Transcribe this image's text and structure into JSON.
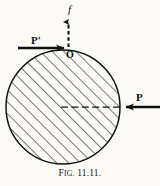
{
  "figure": {
    "caption_prefix": "F",
    "caption_smallcaps": "IG.",
    "caption_number": " 11.11.",
    "caption_full": "FIG. 11.11.",
    "background_color": "#fbfaf6",
    "ink_color": "#101010"
  },
  "labels": {
    "force_f": "f",
    "force_P_prime": "P'",
    "point_O": "O",
    "force_P": "P"
  },
  "diagram": {
    "type": "free-body-diagram",
    "body": {
      "shape": "circle",
      "center_x": 63,
      "center_y": 107,
      "radius": 57,
      "fill": "diagonal-hatching",
      "hatch_angle_deg": 45,
      "hatch_spacing_px": 6
    },
    "point_O": {
      "x": 68,
      "y": 48,
      "label": "O"
    },
    "vectors": [
      {
        "name": "f",
        "style": "dashed",
        "direction": "up",
        "from_x": 68,
        "from_y": 48,
        "to_x": 68,
        "to_y": 17,
        "label": "f"
      },
      {
        "name": "P-prime",
        "style": "solid-bold",
        "direction": "right",
        "from_x": 18,
        "from_y": 48,
        "to_x": 68,
        "to_y": 48,
        "label": "P'"
      },
      {
        "name": "P",
        "style": "solid-bold",
        "direction": "left",
        "from_x": 159,
        "from_y": 107,
        "to_x": 121,
        "to_y": 107,
        "label": "P"
      },
      {
        "name": "radius-line",
        "style": "dashed",
        "direction": "right",
        "from_x": 62,
        "from_y": 107,
        "to_x": 121,
        "to_y": 107,
        "label": ""
      }
    ]
  }
}
